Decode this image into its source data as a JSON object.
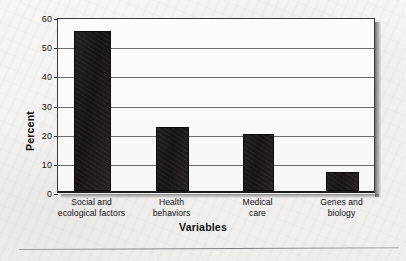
{
  "chart_data": {
    "type": "bar",
    "title": "",
    "xlabel": "Variables",
    "ylabel": "Percent",
    "categories": [
      "Social and ecological factors",
      "Health behaviors",
      "Medical care",
      "Genes and biology"
    ],
    "category_lines": [
      [
        "Social and",
        "ecological factors"
      ],
      [
        "Health",
        "behaviors"
      ],
      [
        "Medical",
        "care"
      ],
      [
        "Genes and",
        "biology"
      ]
    ],
    "values": [
      55,
      22,
      19.5,
      6.5
    ],
    "ylim": [
      0,
      60
    ],
    "yticks": [
      0,
      10,
      20,
      30,
      40,
      50,
      60
    ],
    "ytick_labels": [
      "0",
      "10",
      "20",
      "30",
      "40",
      "50",
      "60"
    ],
    "grid": true,
    "legend": false,
    "bar_color": "#1b1918",
    "axis_color": "#2c2c2c",
    "gridline_color": "#6f6f72",
    "background_color": "#f3f2f0"
  }
}
